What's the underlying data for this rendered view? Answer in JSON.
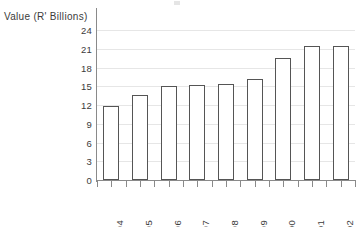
{
  "chart_data": {
    "type": "bar",
    "title": "",
    "subtitle": "",
    "xlabel": "",
    "ylabel": "Value (R' Billions)",
    "categories": [
      "1994",
      "1995",
      "1996",
      "1997",
      "1998",
      "1999",
      "2000",
      "2001",
      "2002"
    ],
    "values": [
      11.8,
      13.6,
      15.1,
      15.2,
      15.3,
      16.2,
      19.5,
      21.4,
      21.4
    ],
    "series": [
      {
        "name": "Value",
        "values": [
          11.8,
          13.6,
          15.1,
          15.2,
          15.3,
          16.2,
          19.5,
          21.4,
          21.4
        ]
      }
    ],
    "ylim": [
      0,
      24
    ],
    "yticks": [
      0,
      3,
      6,
      9,
      12,
      15,
      18,
      21,
      24
    ],
    "ytick_labels": [
      "0",
      "3",
      "6",
      "9",
      "12",
      "15",
      "18",
      "21",
      "24"
    ],
    "grid": true,
    "grid_axis": "y",
    "legend": false,
    "legend_position": "none",
    "bar_fill_color": "#ffffff",
    "bar_edge_color": "#555555",
    "gridline_color": "#e6e6e6",
    "axis_color": "#8a8a8a",
    "text_color": "#3b3b3b",
    "xtick_label_rotation": 90
  }
}
